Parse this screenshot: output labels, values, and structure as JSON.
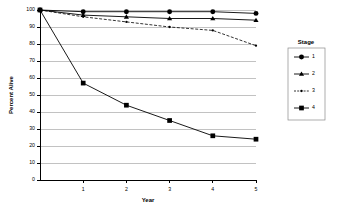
{
  "chart_data": {
    "type": "line",
    "title": "",
    "xlabel": "Year",
    "ylabel": "Percent Alive",
    "x": [
      0,
      1,
      2,
      3,
      4,
      5
    ],
    "xlim": [
      0,
      5
    ],
    "ylim": [
      0,
      100
    ],
    "xticks": [
      "1",
      "2",
      "3",
      "4",
      "5"
    ],
    "yticks": [
      "0",
      "10",
      "20",
      "30",
      "40",
      "50",
      "60",
      "70",
      "80",
      "90",
      "100"
    ],
    "grid": "horizontal",
    "legend_position": "right",
    "legend_title": "Stage",
    "series": [
      {
        "name": "1",
        "marker": "circle",
        "linestyle": "solid",
        "values": [
          100,
          99,
          99,
          99,
          99,
          98
        ]
      },
      {
        "name": "2",
        "marker": "triangle",
        "linestyle": "solid",
        "values": [
          100,
          97,
          96,
          95,
          95,
          94
        ]
      },
      {
        "name": "3",
        "marker": "dot",
        "linestyle": "dashed",
        "values": [
          100,
          96,
          93,
          90,
          88,
          79
        ]
      },
      {
        "name": "4",
        "marker": "square",
        "linestyle": "solid",
        "values": [
          100,
          57,
          44,
          35,
          26,
          24
        ]
      }
    ]
  },
  "colors": {
    "ink": "#000000",
    "grid": "#9a9a9a",
    "background": "#ffffff"
  }
}
